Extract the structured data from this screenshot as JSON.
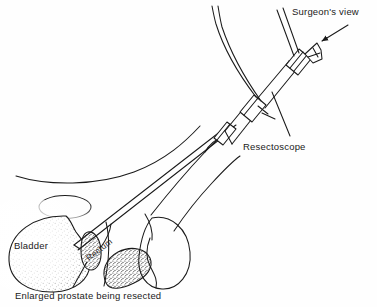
{
  "figure": {
    "background_color": "#fefefe",
    "ink_color": "#1a1a1a",
    "stipple_color": "#4a4a4a"
  },
  "labels": {
    "surgeons_view": "Surgeon's view",
    "resectoscope": "Resectoscope",
    "bladder": "Bladder",
    "rectum": "Rectum",
    "caption": "Enlarged prostate being resected"
  },
  "annotations": [
    {
      "name": "surgeons-view-leader",
      "text": "Surgeon's view",
      "points_to": "eyepiece",
      "has_arrowhead": true
    },
    {
      "name": "resectoscope-leader",
      "text": "Resectoscope",
      "points_to": "instrument-shaft",
      "has_arrowhead": false
    },
    {
      "name": "prostate-leader",
      "text": "Enlarged prostate being resected",
      "points_to": "prostate",
      "has_arrowhead": false
    }
  ],
  "anatomy": [
    {
      "name": "abdominal-wall",
      "shaded": false
    },
    {
      "name": "pubic-bone",
      "shaded": false
    },
    {
      "name": "bladder",
      "shaded": true,
      "label": "Bladder"
    },
    {
      "name": "prostate",
      "shaded": true,
      "label": "Enlarged prostate being resected"
    },
    {
      "name": "rectum",
      "shaded": true,
      "label": "Rectum"
    },
    {
      "name": "penis",
      "shaded": false
    },
    {
      "name": "scrotum",
      "shaded": false
    },
    {
      "name": "perineum",
      "shaded": false
    }
  ],
  "instrument": {
    "name": "resectoscope",
    "angle_degrees": -35,
    "parts": [
      {
        "name": "eyepiece",
        "note": "flared funnel at proximal end"
      },
      {
        "name": "irrigation-tube",
        "note": "curved tube to upper left"
      },
      {
        "name": "light-cable",
        "note": "straight cable to upper right"
      },
      {
        "name": "barrel",
        "note": "main body with collars"
      },
      {
        "name": "collar-proximal"
      },
      {
        "name": "collar-distal"
      },
      {
        "name": "sheath",
        "note": "thin shaft into urethra"
      },
      {
        "name": "cutting-tip",
        "note": "resecting loop at prostate"
      }
    ]
  }
}
